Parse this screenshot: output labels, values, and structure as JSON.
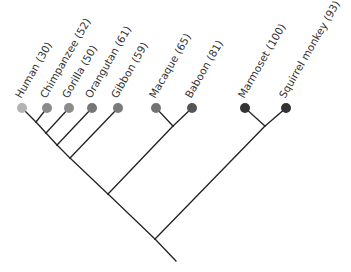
{
  "diagram": {
    "type": "phylogenetic-tree",
    "orientation": "root-bottom, leaves-top, diagonal (cladogram)",
    "leaves": [
      {
        "id": "human",
        "label": "Human (30)",
        "x": 22,
        "y": 108,
        "color": "#b3b3b3"
      },
      {
        "id": "chimpanzee",
        "label": "Chimpanzee (52)",
        "x": 47,
        "y": 108,
        "color": "#8a8a8a"
      },
      {
        "id": "gorilla",
        "label": "Gorilla (50)",
        "x": 69,
        "y": 108,
        "color": "#8c8c8c"
      },
      {
        "id": "orangutan",
        "label": "Orangutan (61)",
        "x": 92,
        "y": 108,
        "color": "#777777"
      },
      {
        "id": "gibbon",
        "label": "Gibbon (59)",
        "x": 118,
        "y": 108,
        "color": "#7a7a7a"
      },
      {
        "id": "macaque",
        "label": "Macaque (65)",
        "x": 156,
        "y": 108,
        "color": "#737373"
      },
      {
        "id": "baboon",
        "label": "Baboon (81)",
        "x": 192,
        "y": 108,
        "color": "#555555"
      },
      {
        "id": "marmoset",
        "label": "Marmoset (100)",
        "x": 245,
        "y": 108,
        "color": "#333333"
      },
      {
        "id": "squirrel",
        "label": "Squirrel monkey (93)",
        "x": 286,
        "y": 108,
        "color": "#333333"
      }
    ],
    "internal_nodes": [
      {
        "id": "n_hc",
        "x": 36,
        "y": 122
      },
      {
        "id": "n_hcg",
        "x": 46,
        "y": 133
      },
      {
        "id": "n_hcgo",
        "x": 57,
        "y": 145
      },
      {
        "id": "n_ape",
        "x": 70,
        "y": 158
      },
      {
        "id": "n_mb",
        "x": 173,
        "y": 126
      },
      {
        "id": "n_catarr",
        "x": 108,
        "y": 194
      },
      {
        "id": "n_ms",
        "x": 265,
        "y": 126
      },
      {
        "id": "n_root",
        "x": 155,
        "y": 239
      }
    ],
    "edges": [
      [
        "human",
        "n_hc"
      ],
      [
        "chimpanzee",
        "n_hc"
      ],
      [
        "n_hc",
        "n_hcg"
      ],
      [
        "gorilla",
        "n_hcg"
      ],
      [
        "n_hcg",
        "n_hcgo"
      ],
      [
        "orangutan",
        "n_hcgo"
      ],
      [
        "n_hcgo",
        "n_ape"
      ],
      [
        "gibbon",
        "n_ape"
      ],
      [
        "macaque",
        "n_mb"
      ],
      [
        "baboon",
        "n_mb"
      ],
      [
        "n_ape",
        "n_catarr"
      ],
      [
        "n_mb",
        "n_catarr"
      ],
      [
        "marmoset",
        "n_ms"
      ],
      [
        "squirrel",
        "n_ms"
      ],
      [
        "n_catarr",
        "n_root"
      ],
      [
        "n_ms",
        "n_root"
      ]
    ],
    "root_stem": {
      "x1": 155,
      "y1": 239,
      "x2": 176,
      "y2": 261
    },
    "label_rotation_deg": -60,
    "node_radius": 5
  }
}
